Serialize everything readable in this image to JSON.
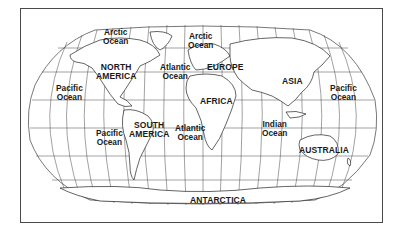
{
  "map": {
    "projection": "robinson-like world map",
    "style": "black line art on white, graticule grid",
    "colors": {
      "background": "#ffffff",
      "frame": "#4a4a4a",
      "lines": "#333333",
      "text": "#1a1a1a"
    },
    "continents": [
      {
        "id": "north-america",
        "lines": [
          "NORTH",
          "AMERICA"
        ]
      },
      {
        "id": "south-america",
        "lines": [
          "SOUTH",
          "AMERICA"
        ]
      },
      {
        "id": "europe",
        "lines": [
          "EUROPE"
        ]
      },
      {
        "id": "africa",
        "lines": [
          "AFRICA"
        ]
      },
      {
        "id": "asia",
        "lines": [
          "ASIA"
        ]
      },
      {
        "id": "australia",
        "lines": [
          "AUSTRALIA"
        ]
      },
      {
        "id": "antarctica",
        "lines": [
          "ANTARCTICA"
        ]
      }
    ],
    "oceans": [
      {
        "id": "arctic-ocean-west",
        "lines": [
          "Arctic",
          "Ocean"
        ]
      },
      {
        "id": "arctic-ocean-east",
        "lines": [
          "Arctic",
          "Ocean"
        ]
      },
      {
        "id": "pacific-ocean-north-west",
        "lines": [
          "Pacific",
          "Ocean"
        ]
      },
      {
        "id": "pacific-ocean-south",
        "lines": [
          "Pacific",
          "Ocean"
        ]
      },
      {
        "id": "pacific-ocean-east",
        "lines": [
          "Pacific",
          "Ocean"
        ]
      },
      {
        "id": "atlantic-ocean-north",
        "lines": [
          "Atlantic",
          "Ocean"
        ]
      },
      {
        "id": "atlantic-ocean-south",
        "lines": [
          "Atlantic",
          "Ocean"
        ]
      },
      {
        "id": "indian-ocean",
        "lines": [
          "Indian",
          "Ocean"
        ]
      }
    ]
  }
}
